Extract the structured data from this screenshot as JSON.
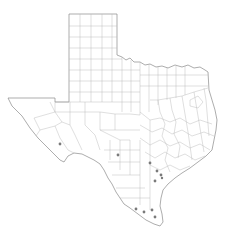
{
  "map": {
    "region": "Texas",
    "subdivision": "counties",
    "colors": {
      "background": "#ffffff",
      "state_outline": "#8a8a8a",
      "county_lines": "#b8b8b8",
      "marker": "#7a7a7a"
    },
    "markers": [
      {
        "x": 60,
        "y": 144
      },
      {
        "x": 118,
        "y": 155
      },
      {
        "x": 150,
        "y": 163
      },
      {
        "x": 157,
        "y": 171
      },
      {
        "x": 161,
        "y": 175
      },
      {
        "x": 155,
        "y": 181
      },
      {
        "x": 136,
        "y": 209
      },
      {
        "x": 144,
        "y": 212
      },
      {
        "x": 152,
        "y": 210
      },
      {
        "x": 155,
        "y": 217
      },
      {
        "x": 162,
        "y": 178
      }
    ]
  }
}
